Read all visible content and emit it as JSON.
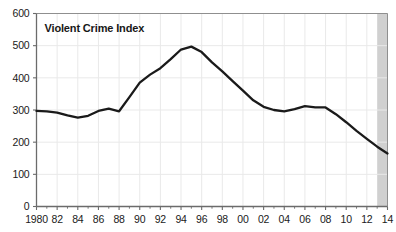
{
  "chart_data": {
    "type": "line",
    "title": "Violent Crime Index",
    "xlabel": "",
    "ylabel": "",
    "xlim": [
      1980,
      2014
    ],
    "ylim": [
      0,
      600
    ],
    "grid": true,
    "legend": "none",
    "y_ticks": [
      "600",
      "500",
      "400",
      "300",
      "200",
      "100",
      "0"
    ],
    "y_tick_values": [
      600,
      500,
      400,
      300,
      200,
      100,
      0
    ],
    "x_ticks": [
      "1980",
      "82",
      "84",
      "86",
      "88",
      "90",
      "92",
      "94",
      "96",
      "98",
      "00",
      "02",
      "04",
      "06",
      "08",
      "10",
      "12",
      "14"
    ],
    "x_tick_values": [
      1980,
      1982,
      1984,
      1986,
      1988,
      1990,
      1992,
      1994,
      1996,
      1998,
      2000,
      2002,
      2004,
      2006,
      2008,
      2010,
      2012,
      2014
    ],
    "series": [
      {
        "name": "Violent Crime Index",
        "color": "#1a1a1a",
        "x": [
          1980,
          1981,
          1982,
          1983,
          1984,
          1985,
          1986,
          1987,
          1988,
          1989,
          1990,
          1991,
          1992,
          1993,
          1994,
          1995,
          1996,
          1997,
          1998,
          1999,
          2000,
          2001,
          2002,
          2003,
          2004,
          2005,
          2006,
          2007,
          2008,
          2009,
          2010,
          2011,
          2012,
          2013,
          2014
        ],
        "values": [
          297,
          296,
          292,
          283,
          276,
          282,
          297,
          304,
          296,
          340,
          385,
          410,
          430,
          458,
          488,
          497,
          480,
          448,
          420,
          390,
          360,
          330,
          310,
          300,
          296,
          303,
          312,
          308,
          308,
          287,
          262,
          235,
          210,
          186,
          165
        ]
      }
    ],
    "shaded_band": {
      "name": "projection-band",
      "x_start": 2013,
      "x_end": 2014,
      "color": "#c8c8c8"
    },
    "colors": {
      "line": "#1a1a1a",
      "axis": "#6b6b6b",
      "grid": "#e9e9e9",
      "band": "#c8c8c8",
      "text": "#1a1a1a",
      "background": "#ffffff"
    }
  }
}
